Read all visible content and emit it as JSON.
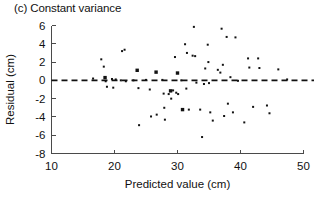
{
  "panel": {
    "title": "(c) Constant variance"
  },
  "chart_data": {
    "type": "scatter",
    "title": "(c) Constant variance",
    "xlabel": "Predicted value (cm)",
    "ylabel": "Residual (cm)",
    "xlim": [
      10,
      50
    ],
    "ylim": [
      -8,
      6
    ],
    "xticks": [
      10,
      20,
      30,
      40,
      50
    ],
    "yticks": [
      6,
      4,
      2,
      0,
      -2,
      -4,
      -6,
      -8
    ],
    "grid": false,
    "legend": null,
    "reference_lines": [
      {
        "orientation": "horizontal",
        "value": 0,
        "style": "dashed",
        "color": "#111111"
      }
    ],
    "marker_color": "#121212",
    "marker_note": "Small square markers; a few appear larger/bolder where observations overlap.",
    "points": [
      {
        "x": 16.6,
        "y": 0.2,
        "size": 1
      },
      {
        "x": 17.9,
        "y": 2.3,
        "size": 1
      },
      {
        "x": 18.3,
        "y": 1.5,
        "size": 1
      },
      {
        "x": 18.5,
        "y": 0.3,
        "size": 2
      },
      {
        "x": 18.6,
        "y": -0.1,
        "size": 1
      },
      {
        "x": 18.8,
        "y": -0.7,
        "size": 1
      },
      {
        "x": 19.6,
        "y": 0.15,
        "size": 1
      },
      {
        "x": 19.8,
        "y": -0.8,
        "size": 1
      },
      {
        "x": 20.2,
        "y": 0.1,
        "size": 1
      },
      {
        "x": 21.0,
        "y": 0.0,
        "size": 1
      },
      {
        "x": 21.2,
        "y": 3.2,
        "size": 1
      },
      {
        "x": 21.6,
        "y": 3.35,
        "size": 1
      },
      {
        "x": 21.8,
        "y": -0.1,
        "size": 1
      },
      {
        "x": 23.0,
        "y": 0.0,
        "size": 1
      },
      {
        "x": 23.6,
        "y": 1.1,
        "size": 2
      },
      {
        "x": 23.8,
        "y": -0.85,
        "size": 1
      },
      {
        "x": 23.9,
        "y": -4.9,
        "size": 1
      },
      {
        "x": 25.0,
        "y": 0.05,
        "size": 1
      },
      {
        "x": 25.6,
        "y": -1.0,
        "size": 1
      },
      {
        "x": 25.8,
        "y": -3.95,
        "size": 1
      },
      {
        "x": 26.6,
        "y": 0.9,
        "size": 2
      },
      {
        "x": 26.7,
        "y": -3.75,
        "size": 1
      },
      {
        "x": 27.6,
        "y": 0.05,
        "size": 1
      },
      {
        "x": 27.8,
        "y": -1.45,
        "size": 1
      },
      {
        "x": 27.9,
        "y": -3.0,
        "size": 1
      },
      {
        "x": 28.0,
        "y": -4.3,
        "size": 1
      },
      {
        "x": 28.6,
        "y": -1.5,
        "size": 1
      },
      {
        "x": 28.9,
        "y": -1.15,
        "size": 2
      },
      {
        "x": 29.0,
        "y": -2.0,
        "size": 1
      },
      {
        "x": 29.3,
        "y": -1.1,
        "size": 1
      },
      {
        "x": 29.6,
        "y": 2.55,
        "size": 1
      },
      {
        "x": 29.8,
        "y": -1.35,
        "size": 1
      },
      {
        "x": 30.0,
        "y": 0.8,
        "size": 2
      },
      {
        "x": 30.1,
        "y": -1.5,
        "size": 1
      },
      {
        "x": 30.6,
        "y": 0.0,
        "size": 1
      },
      {
        "x": 30.8,
        "y": -3.2,
        "size": 2
      },
      {
        "x": 31.2,
        "y": 3.95,
        "size": 1
      },
      {
        "x": 31.4,
        "y": -0.9,
        "size": 1
      },
      {
        "x": 31.5,
        "y": 3.0,
        "size": 1
      },
      {
        "x": 31.8,
        "y": -3.2,
        "size": 1
      },
      {
        "x": 32.4,
        "y": 2.7,
        "size": 1
      },
      {
        "x": 32.6,
        "y": 5.85,
        "size": 1
      },
      {
        "x": 32.8,
        "y": 2.65,
        "size": 1
      },
      {
        "x": 33.0,
        "y": -0.25,
        "size": 1
      },
      {
        "x": 33.6,
        "y": -3.2,
        "size": 1
      },
      {
        "x": 33.9,
        "y": -6.2,
        "size": 1
      },
      {
        "x": 34.2,
        "y": -0.4,
        "size": 1
      },
      {
        "x": 34.4,
        "y": 1.3,
        "size": 1
      },
      {
        "x": 34.8,
        "y": 3.9,
        "size": 1
      },
      {
        "x": 34.9,
        "y": 2.0,
        "size": 1
      },
      {
        "x": 35.0,
        "y": -0.3,
        "size": 1
      },
      {
        "x": 35.2,
        "y": -3.5,
        "size": 1
      },
      {
        "x": 35.6,
        "y": -4.4,
        "size": 1
      },
      {
        "x": 36.4,
        "y": 1.15,
        "size": 1
      },
      {
        "x": 36.8,
        "y": 0.85,
        "size": 1
      },
      {
        "x": 37.0,
        "y": 5.65,
        "size": 1
      },
      {
        "x": 37.2,
        "y": 1.7,
        "size": 1
      },
      {
        "x": 37.4,
        "y": -3.9,
        "size": 1
      },
      {
        "x": 37.8,
        "y": 4.75,
        "size": 1
      },
      {
        "x": 38.0,
        "y": -2.55,
        "size": 1
      },
      {
        "x": 38.4,
        "y": 0.35,
        "size": 1
      },
      {
        "x": 38.8,
        "y": -3.5,
        "size": 1
      },
      {
        "x": 39.2,
        "y": 4.7,
        "size": 1
      },
      {
        "x": 39.6,
        "y": -0.05,
        "size": 1
      },
      {
        "x": 40.6,
        "y": -4.6,
        "size": 1
      },
      {
        "x": 41.2,
        "y": 2.4,
        "size": 1
      },
      {
        "x": 41.4,
        "y": 1.4,
        "size": 1
      },
      {
        "x": 42.0,
        "y": -2.9,
        "size": 1
      },
      {
        "x": 42.8,
        "y": 2.4,
        "size": 1
      },
      {
        "x": 43.0,
        "y": 1.35,
        "size": 1
      },
      {
        "x": 44.2,
        "y": -2.75,
        "size": 1
      },
      {
        "x": 44.6,
        "y": -3.6,
        "size": 1
      },
      {
        "x": 46.0,
        "y": 1.2,
        "size": 1
      },
      {
        "x": 47.4,
        "y": 0.1,
        "size": 1
      }
    ]
  }
}
